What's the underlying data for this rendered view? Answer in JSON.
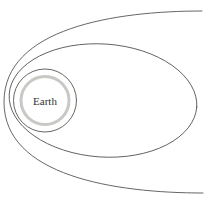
{
  "diagram": {
    "type": "orbital-trajectories-diagram",
    "earth_label": "Earth",
    "curves": [
      {
        "name": "escape-trajectory",
        "shape": "open-hyperbolic-curve"
      },
      {
        "name": "elliptical-orbit",
        "shape": "ellipse"
      },
      {
        "name": "circular-orbit",
        "shape": "circle"
      },
      {
        "name": "earth-body",
        "shape": "circle"
      }
    ]
  },
  "colors": {
    "background": "#ffffff",
    "line": "#555555",
    "earth_outline": "#c6c9c4",
    "label_text": "#333333"
  }
}
